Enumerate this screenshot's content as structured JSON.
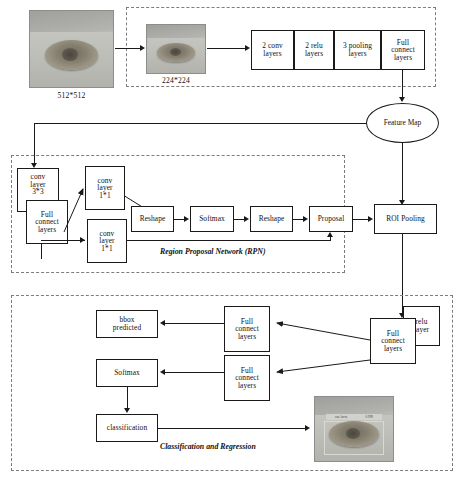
{
  "diagram": {
    "stages": {
      "input": {
        "image_alt": "grayscale photo of a larva on soil",
        "caption": "512*512"
      },
      "resized": {
        "image_alt": "resized grayscale photo of a larva on soil",
        "caption": "224*224"
      },
      "backbone": {
        "layers": [
          "2 conv\nlayers",
          "2 relu\nlayers",
          "3 pooling\nlayers",
          "Full\nconnect\nlayers"
        ],
        "layer_labels": [
          [
            "2 conv",
            "layers"
          ],
          [
            "2 relu",
            "layers"
          ],
          [
            "3 pooling",
            "layers"
          ],
          [
            "Full",
            "connect",
            "layers"
          ]
        ]
      },
      "feature_map": {
        "label_line1": "Feature",
        "label_line2": "Map"
      },
      "roi_pooling": {
        "label": "ROI Pooling"
      }
    },
    "rpn": {
      "group_label": "Region Proposal Network (RPN)",
      "nodes": {
        "conv3x3": [
          "conv",
          "layer",
          "3*3"
        ],
        "full_connect": [
          "Full",
          "connect",
          "layers"
        ],
        "conv1x1_top": [
          "conv",
          "layer",
          "1*1"
        ],
        "conv1x1_bottom": [
          "conv",
          "layer",
          "1*1"
        ],
        "reshape_1": "Reshape",
        "softmax": "Softmax",
        "reshape_2": "Reshape",
        "proposal": "Proposal"
      }
    },
    "head": {
      "group_label_line1": "Classification",
      "group_label_line2": "and Regression",
      "nodes": {
        "full_connect_main": [
          "Full",
          "connect",
          "layers"
        ],
        "relu_layer": [
          "relu",
          "layer"
        ],
        "full_connect_bbox": [
          "Full",
          "connect",
          "layers"
        ],
        "full_connect_cls": [
          "Full",
          "connect",
          "layers"
        ],
        "bbox_predicted": [
          "bbox",
          "predicted"
        ],
        "softmax": "Softmax",
        "classification": "classification"
      },
      "result": {
        "image_alt": "detection result: larva with bounding box and score label",
        "detection_label_left": "one larva",
        "detection_label_right": "0.999"
      }
    },
    "colors": {
      "stroke": "#1a1a1a",
      "dashed_group": "#7d7d7d",
      "background": "#ffffff"
    }
  }
}
